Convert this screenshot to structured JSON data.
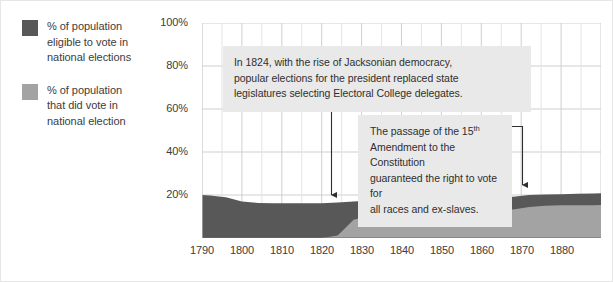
{
  "legend": {
    "items": [
      {
        "swatch_color": "#585858",
        "label": "% of population\neligible to vote in\nnational elections",
        "icon": "square-swatch-dark"
      },
      {
        "swatch_color": "#a3a3a3",
        "label": "% of population\nthat did vote in\nnational election",
        "icon": "square-swatch-light"
      }
    ]
  },
  "annotations": {
    "jacksonian": {
      "line1": "In 1824, with the rise of Jacksonian democracy,",
      "line2": "popular elections for the president replaced state",
      "line3": "legislatures selecting Electoral College delegates.",
      "background": "#e9e9e9"
    },
    "amendment": {
      "pre": "The passage of the 15",
      "sup": "th",
      "rest": "\nAmendment to the Constitution\nguaranteed the right to vote for\nall races and ex-slaves.",
      "background": "#e9e9e9"
    }
  },
  "axes": {
    "y_ticks": [
      "100%",
      "80%",
      "60%",
      "40%",
      "20%"
    ],
    "x_ticks": [
      "1790",
      "1800",
      "1810",
      "1820",
      "1830",
      "1840",
      "1850",
      "1860",
      "1870",
      "1880"
    ]
  },
  "colors": {
    "eligible": "#585858",
    "voted": "#a3a3a3",
    "grid": "#cfcfcf",
    "grid_minor": "#e4e4e4",
    "axis": "#6f6f6f",
    "arrow": "#2f2f2f",
    "text": "#3c3c3c",
    "page_bg": "#ffffff"
  },
  "chart_data": {
    "type": "area",
    "title": "",
    "xlabel": "",
    "ylabel": "",
    "xlim": [
      1790,
      1890
    ],
    "ylim": [
      0,
      100
    ],
    "grid": true,
    "legend_position": "left-outside",
    "stacked": false,
    "x": [
      1790,
      1792,
      1796,
      1800,
      1804,
      1808,
      1812,
      1816,
      1820,
      1824,
      1828,
      1832,
      1836,
      1840,
      1844,
      1848,
      1852,
      1856,
      1860,
      1864,
      1868,
      1872,
      1876,
      1880,
      1884,
      1888,
      1890
    ],
    "series": [
      {
        "name": "% of population eligible to vote in national elections",
        "color": "#585858",
        "values": [
          20.0,
          19.8,
          19.0,
          17.0,
          16.3,
          16.2,
          16.2,
          16.2,
          16.2,
          16.5,
          17.0,
          17.4,
          17.6,
          18.0,
          18.2,
          18.2,
          18.0,
          18.0,
          19.3,
          19.6,
          19.2,
          20.0,
          20.2,
          20.4,
          20.6,
          20.7,
          20.8
        ]
      },
      {
        "name": "% of population that did vote in national election",
        "color": "#a3a3a3",
        "values": [
          0.0,
          0.0,
          0.0,
          0.0,
          0.0,
          0.0,
          0.0,
          0.0,
          0.0,
          1.2,
          8.5,
          10.4,
          11.0,
          13.2,
          13.4,
          12.8,
          12.6,
          12.8,
          14.4,
          13.4,
          13.3,
          14.4,
          15.0,
          15.2,
          15.2,
          15.2,
          15.3
        ]
      }
    ],
    "callouts": [
      {
        "name": "jacksonian-arrow",
        "x_year": 1826,
        "from_pct": 74,
        "to_pct": 22
      },
      {
        "name": "amendment-arrow",
        "x_year": 1871,
        "from_pct": 52,
        "to_pct": 23
      }
    ]
  }
}
